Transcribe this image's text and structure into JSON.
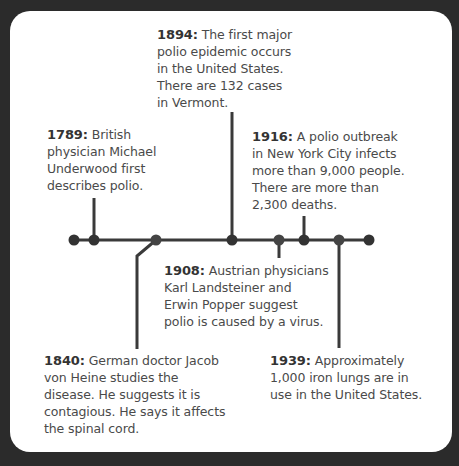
{
  "timeline": {
    "events": [
      {
        "year": "1789:",
        "text": "British\nphysician Michael\nUnderwood first\ndescribes polio."
      },
      {
        "year": "1840:",
        "text": "German doctor Jacob\nvon Heine studies the\ndisease. He suggests it is\ncontagious. He says it affects\nthe spinal cord."
      },
      {
        "year": "1894:",
        "text": "The first major\npolio epidemic occurs\nin the United States.\nThere are 132 cases\nin Vermont."
      },
      {
        "year": "1908:",
        "text": "Austrian physicians\nKarl Landsteiner and\nErwin Popper suggest\npolio is caused by a virus."
      },
      {
        "year": "1916:",
        "text": "A polio outbreak\nin New York City infects\nmore than 9,000 people.\nThere are more than\n2,300 deaths."
      },
      {
        "year": "1939:",
        "text": "Approximately\n1,000 iron lungs are in\nuse in the United States."
      }
    ]
  },
  "colors": {
    "line": "#3a3a3a",
    "background": "#2b2b2b",
    "card": "#ffffff"
  }
}
